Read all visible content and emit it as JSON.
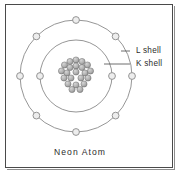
{
  "figure": {
    "caption": "Neon Atom",
    "background_color": "#ffffff",
    "border_color": "#4a4a4a",
    "shell_stroke_color": "#8a8a8a",
    "electron_fill_color": "#ededed",
    "nucleon_color": "#b0b0b0",
    "label_color": "#2c2c2c"
  },
  "labels": {
    "outer_shell": "L shell",
    "inner_shell": "K shell"
  },
  "chart_data": {
    "type": "diagram",
    "title": "Neon Atom",
    "subtitle": "",
    "element": "Neon",
    "center": {
      "x": 76,
      "y": 76
    },
    "nucleus": {
      "nucleon_count": 20,
      "proton_count": 10,
      "neutron_count": 10,
      "nucleon_radius": 3.1,
      "cluster_radius": 16,
      "positions": [
        {
          "x": 76,
          "y": 60
        },
        {
          "x": 70,
          "y": 61.5
        },
        {
          "x": 82,
          "y": 61.5
        },
        {
          "x": 64.5,
          "y": 65
        },
        {
          "x": 76,
          "y": 66
        },
        {
          "x": 87.5,
          "y": 65
        },
        {
          "x": 70,
          "y": 67.5
        },
        {
          "x": 82,
          "y": 67.5
        },
        {
          "x": 61.5,
          "y": 71
        },
        {
          "x": 67,
          "y": 73
        },
        {
          "x": 76,
          "y": 72
        },
        {
          "x": 85,
          "y": 73
        },
        {
          "x": 90.5,
          "y": 71
        },
        {
          "x": 64,
          "y": 78
        },
        {
          "x": 71,
          "y": 78
        },
        {
          "x": 81,
          "y": 78
        },
        {
          "x": 88,
          "y": 78
        },
        {
          "x": 68,
          "y": 84
        },
        {
          "x": 76,
          "y": 85
        },
        {
          "x": 84,
          "y": 84
        },
        {
          "x": 72,
          "y": 89.5
        },
        {
          "x": 80,
          "y": 89.5
        }
      ]
    },
    "shells": [
      {
        "name": "K shell",
        "order": 1,
        "radius": 36,
        "electron_count": 2,
        "electron_radius": 3.4,
        "electron_angles_deg": [
          180,
          0
        ]
      },
      {
        "name": "L shell",
        "order": 2,
        "radius": 56,
        "electron_count": 8,
        "electron_radius": 3.4,
        "electron_angles_deg": [
          270,
          315,
          0,
          45,
          90,
          135,
          180,
          225
        ]
      }
    ],
    "annotations": [
      {
        "text": "L shell",
        "text_x": 136,
        "text_y": 51,
        "leader_from": {
          "x": 130,
          "y": 51
        },
        "leader_to": {
          "x": 121,
          "y": 51
        }
      },
      {
        "text": "K shell",
        "text_x": 136,
        "text_y": 64,
        "leader_from": {
          "x": 130,
          "y": 64
        },
        "leader_to": {
          "x": 104,
          "y": 64
        }
      }
    ],
    "caption": {
      "text": "Neon Atom",
      "x": 80,
      "y": 155
    }
  }
}
